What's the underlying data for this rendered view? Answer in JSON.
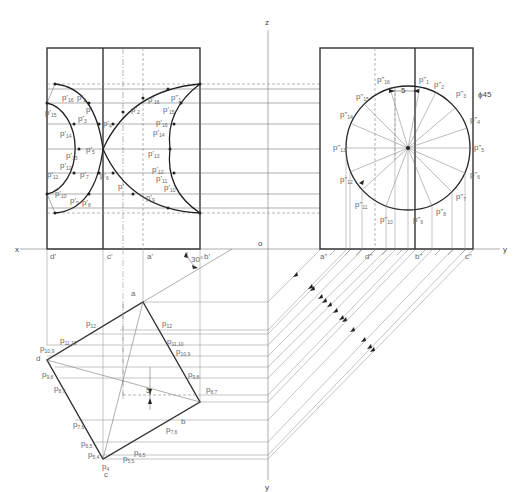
{
  "drawing": {
    "axis_labels": {
      "x": "x",
      "y_right": "y",
      "y_bottom": "y",
      "z": "z",
      "origin": "o"
    },
    "front_view_ground_labels": [
      "d'",
      "c'",
      "a'",
      "b'"
    ],
    "side_view_ground_labels": [
      "a\"",
      "d\"",
      "b\"",
      "c\""
    ],
    "annotations": {
      "angle": "30°",
      "offset_side": "5",
      "offset_top": "5",
      "diameter": "ϕ45"
    },
    "top_view_vertices": [
      "a",
      "b",
      "c",
      "d"
    ],
    "top_view_points": [
      "p12",
      "p11,10",
      "p10,9",
      "p9,8",
      "p8,7",
      "p7,6",
      "p6,5",
      "p5,4",
      "p4",
      "p3,3",
      "p12",
      "p11,12",
      "p10,9",
      "p9,8",
      "p8,7",
      "p7,6",
      "p6,5",
      "p5,5"
    ],
    "side_view_points": [
      "p\"1",
      "p\"2",
      "p\"3",
      "p\"4",
      "p\"5",
      "p\"6",
      "p\"7",
      "p\"8",
      "p\"9",
      "p\"10",
      "p\"11",
      "p\"12",
      "p\"13",
      "p\"14",
      "p\"15",
      "p\"16"
    ],
    "front_view_points": [
      "p'1",
      "p'2",
      "p'3",
      "p'4",
      "p'5",
      "p'6",
      "p'7",
      "p'8",
      "p'9",
      "p'10",
      "p'11",
      "p'12",
      "p'13",
      "p'14",
      "p'15",
      "p'16"
    ]
  }
}
